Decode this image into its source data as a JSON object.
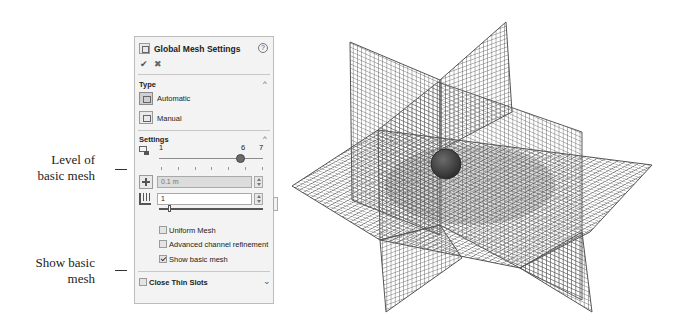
{
  "callouts": [
    {
      "id": "level",
      "lines": [
        "Level of",
        "basic mesh"
      ]
    },
    {
      "id": "show",
      "lines": [
        "Show basic",
        "mesh"
      ]
    }
  ],
  "panel": {
    "title": "Global Mesh Settings",
    "help_icon": "help-icon",
    "ok_icon": "checkmark-icon",
    "cancel_icon": "close-icon",
    "type_section": {
      "label": "Type",
      "collapse_icon": "chevron-up-icon",
      "options": [
        {
          "label": "Automatic",
          "icon": "automatic-mesh-icon",
          "selected": true
        },
        {
          "label": "Manual",
          "icon": "manual-mesh-icon",
          "selected": false
        }
      ]
    },
    "settings_section": {
      "label": "Settings",
      "collapse_icon": "chevron-up-icon",
      "level_slider": {
        "icon": "level-of-mesh-icon",
        "min_label": "1",
        "value_label": "6",
        "max_label": "7",
        "value": 6,
        "min": 1,
        "max": 7
      },
      "min_gap_field": {
        "icon": "minimum-gap-icon",
        "value": "0.1 m",
        "disabled": true
      },
      "min_wall_field": {
        "icon": "minimum-wall-thickness-icon",
        "value": "1"
      },
      "checkboxes": [
        {
          "label": "Uniform Mesh",
          "checked": false
        },
        {
          "label": "Advanced channel refinement",
          "checked": false
        },
        {
          "label": "Show basic mesh",
          "checked": true
        }
      ]
    },
    "close_thin_slots": {
      "label": "Close Thin Slots",
      "checked": false,
      "expand_icon": "chevron-down-icon"
    }
  },
  "viewport": {
    "description": "3D basic mesh preview: three orthogonal grid planes with a sphere at the center",
    "grid_color": "#555555",
    "sphere_color": "#3a3a3a"
  }
}
